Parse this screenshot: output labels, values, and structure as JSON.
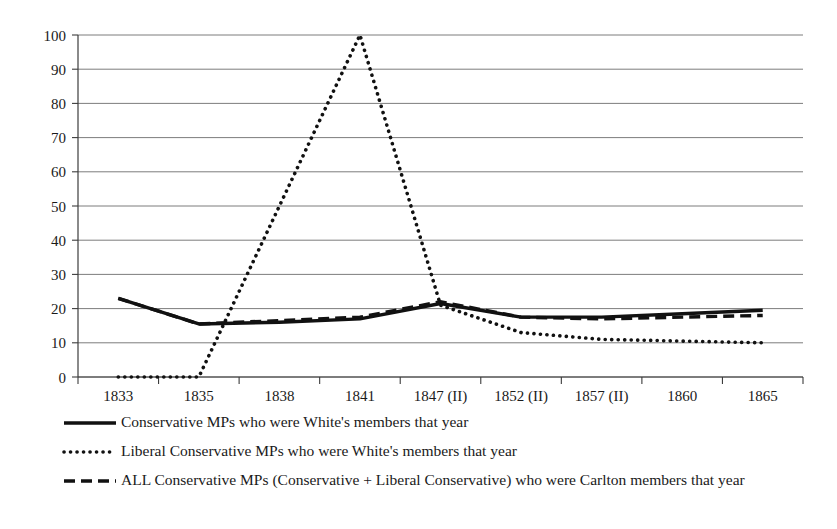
{
  "chart_data": {
    "type": "line",
    "title": "",
    "xlabel": "",
    "ylabel": "",
    "ylim": [
      0,
      100
    ],
    "ytick_step": 10,
    "grid": true,
    "legend_position": "bottom",
    "categories": [
      "1833",
      "1835",
      "1838",
      "1841",
      "1847 (II)",
      "1852 (II)",
      "1857 (II)",
      "1860",
      "1865"
    ],
    "yticks": [
      "0",
      "10",
      "20",
      "30",
      "40",
      "50",
      "60",
      "70",
      "80",
      "90",
      "100"
    ],
    "series": [
      {
        "name": "Conservative MPs who were White's members that year",
        "style": "solid",
        "color": "#111111",
        "values": [
          23,
          15.5,
          16,
          17,
          21.5,
          17.5,
          17.5,
          18.5,
          19.5
        ]
      },
      {
        "name": "Liberal Conservative MPs who were White's members that year",
        "style": "dotted",
        "color": "#111111",
        "values": [
          0,
          0,
          50,
          100,
          21,
          13,
          11,
          10.5,
          10
        ]
      },
      {
        "name": "ALL Conservative MPs (Conservative + Liberal Conservative) who were Carlton members that year",
        "style": "dashed",
        "color": "#111111",
        "values": [
          23,
          15.5,
          16.5,
          17.5,
          22,
          17.5,
          17,
          17.5,
          18
        ]
      }
    ]
  },
  "legend": {
    "items": [
      {
        "marker": "solid-line-marker",
        "label": "Conservative MPs who were White's members that year"
      },
      {
        "marker": "dotted-line-marker",
        "label": "Liberal Conservative MPs who were White's members that year"
      },
      {
        "marker": "dashed-line-marker",
        "label": "ALL Conservative MPs (Conservative + Liberal Conservative) who were Carlton members that year"
      }
    ]
  }
}
